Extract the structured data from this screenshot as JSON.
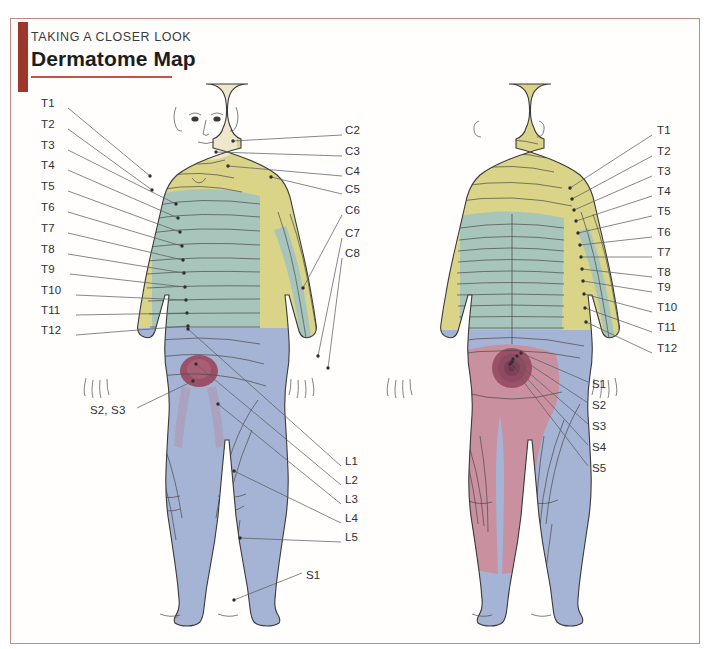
{
  "page": {
    "kicker": "TAKING A CLOSER LOOK",
    "title": "Dermatome Map",
    "frame_color": "#c08b82",
    "accent_bar_color": "#9e372b",
    "rule_color": "#c8534a"
  },
  "palette": {
    "skin": "#f0e6cc",
    "yellow": "#d9d487",
    "teal": "#a8c5bc",
    "blue": "#a5b3d4",
    "rose": "#c9909f",
    "magenta": "#9b5068",
    "outline": "#3a3a3a",
    "leader": "#555a5e"
  },
  "figures": [
    {
      "id": "anterior",
      "view": "anterior-body-figure"
    },
    {
      "id": "posterior",
      "view": "posterior-body-figure"
    }
  ],
  "labels": {
    "left_column": [
      {
        "text": "T1",
        "x": 41,
        "y": 104,
        "lx": 68,
        "ly": 108,
        "tx": 150,
        "ty": 176
      },
      {
        "text": "T2",
        "x": 41,
        "y": 125,
        "lx": 68,
        "ly": 129,
        "tx": 152,
        "ty": 190
      },
      {
        "text": "T3",
        "x": 41,
        "y": 146,
        "lx": 68,
        "ly": 150,
        "tx": 176,
        "ty": 204
      },
      {
        "text": "T4",
        "x": 41,
        "y": 166,
        "lx": 68,
        "ly": 170,
        "tx": 178,
        "ty": 218
      },
      {
        "text": "T5",
        "x": 41,
        "y": 187,
        "lx": 68,
        "ly": 191,
        "tx": 180,
        "ty": 232
      },
      {
        "text": "T6",
        "x": 41,
        "y": 208,
        "lx": 68,
        "ly": 212,
        "tx": 182,
        "ty": 246
      },
      {
        "text": "T7",
        "x": 41,
        "y": 229,
        "lx": 68,
        "ly": 233,
        "tx": 183,
        "ty": 260
      },
      {
        "text": "T8",
        "x": 41,
        "y": 250,
        "lx": 68,
        "ly": 254,
        "tx": 184,
        "ty": 273
      },
      {
        "text": "T9",
        "x": 41,
        "y": 270,
        "lx": 70,
        "ly": 274,
        "tx": 185,
        "ty": 287
      },
      {
        "text": "T10",
        "x": 41,
        "y": 291,
        "lx": 76,
        "ly": 295,
        "tx": 186,
        "ty": 300
      },
      {
        "text": "T11",
        "x": 41,
        "y": 311,
        "lx": 76,
        "ly": 315,
        "tx": 187,
        "ty": 313
      },
      {
        "text": "T12",
        "x": 41,
        "y": 331,
        "lx": 76,
        "ly": 335,
        "tx": 188,
        "ty": 326
      }
    ],
    "left_other": [
      {
        "text": "S2, S3",
        "x": 90,
        "y": 411,
        "lx": 137,
        "ly": 408,
        "tx": 193,
        "ty": 381
      }
    ],
    "center_cervical": [
      {
        "text": "C2",
        "x": 345,
        "y": 131,
        "lx": 342,
        "ly": 135,
        "tx": 233,
        "ty": 141
      },
      {
        "text": "C3",
        "x": 345,
        "y": 152,
        "lx": 342,
        "ly": 156,
        "tx": 216,
        "ty": 152
      },
      {
        "text": "C4",
        "x": 345,
        "y": 172,
        "lx": 342,
        "ly": 176,
        "tx": 228,
        "ty": 166
      },
      {
        "text": "C5",
        "x": 345,
        "y": 190,
        "lx": 342,
        "ly": 194,
        "tx": 271,
        "ty": 177
      },
      {
        "text": "C6",
        "x": 345,
        "y": 211,
        "lx": 342,
        "ly": 215,
        "tx": 303,
        "ty": 288
      },
      {
        "text": "C7",
        "x": 345,
        "y": 234,
        "lx": 342,
        "ly": 238,
        "tx": 318,
        "ty": 356
      },
      {
        "text": "C8",
        "x": 345,
        "y": 254,
        "lx": 342,
        "ly": 258,
        "tx": 328,
        "ty": 368
      }
    ],
    "center_lumbar": [
      {
        "text": "L1",
        "x": 345,
        "y": 462,
        "lx": 341,
        "ly": 466,
        "tx": 188,
        "ty": 329
      },
      {
        "text": "L2",
        "x": 345,
        "y": 481,
        "lx": 341,
        "ly": 485,
        "tx": 196,
        "ty": 364
      },
      {
        "text": "L3",
        "x": 345,
        "y": 500,
        "lx": 341,
        "ly": 504,
        "tx": 218,
        "ty": 404
      },
      {
        "text": "L4",
        "x": 345,
        "y": 519,
        "lx": 341,
        "ly": 523,
        "tx": 234,
        "ty": 471
      },
      {
        "text": "L5",
        "x": 345,
        "y": 538,
        "lx": 341,
        "ly": 542,
        "tx": 240,
        "ty": 538
      }
    ],
    "right_column": [
      {
        "text": "T1",
        "x": 657,
        "y": 131,
        "lx": 652,
        "ly": 135,
        "tx": 570,
        "ty": 188
      },
      {
        "text": "T2",
        "x": 657,
        "y": 152,
        "lx": 652,
        "ly": 156,
        "tx": 572,
        "ty": 199
      },
      {
        "text": "T3",
        "x": 657,
        "y": 172,
        "lx": 652,
        "ly": 176,
        "tx": 574,
        "ty": 210
      },
      {
        "text": "T4",
        "x": 657,
        "y": 192,
        "lx": 652,
        "ly": 196,
        "tx": 576,
        "ty": 221
      },
      {
        "text": "T5",
        "x": 657,
        "y": 212,
        "lx": 652,
        "ly": 216,
        "tx": 578,
        "ty": 233
      },
      {
        "text": "T6",
        "x": 657,
        "y": 233,
        "lx": 652,
        "ly": 237,
        "tx": 580,
        "ty": 245
      },
      {
        "text": "T7",
        "x": 657,
        "y": 253,
        "lx": 652,
        "ly": 257,
        "tx": 581,
        "ty": 257
      },
      {
        "text": "T8",
        "x": 657,
        "y": 273,
        "lx": 652,
        "ly": 277,
        "tx": 582,
        "ty": 269
      },
      {
        "text": "T9",
        "x": 657,
        "y": 288,
        "lx": 652,
        "ly": 292,
        "tx": 583,
        "ty": 281
      },
      {
        "text": "T10",
        "x": 657,
        "y": 308,
        "lx": 652,
        "ly": 312,
        "tx": 584,
        "ty": 294
      },
      {
        "text": "T11",
        "x": 657,
        "y": 328,
        "lx": 652,
        "ly": 332,
        "tx": 585,
        "ty": 308
      },
      {
        "text": "T12",
        "x": 657,
        "y": 349,
        "lx": 652,
        "ly": 353,
        "tx": 586,
        "ty": 322
      }
    ],
    "right_sacral": [
      {
        "text": "S1",
        "x": 592,
        "y": 385,
        "lx": 588,
        "ly": 382,
        "tx": 521,
        "ty": 353
      },
      {
        "text": "S2",
        "x": 592,
        "y": 406,
        "lx": 588,
        "ly": 403,
        "tx": 517,
        "ty": 356
      },
      {
        "text": "S3",
        "x": 592,
        "y": 427,
        "lx": 588,
        "ly": 424,
        "tx": 513,
        "ty": 359
      },
      {
        "text": "S4",
        "x": 592,
        "y": 448,
        "lx": 588,
        "ly": 445,
        "tx": 512,
        "ty": 362
      },
      {
        "text": "S5",
        "x": 592,
        "y": 469,
        "lx": 588,
        "ly": 466,
        "tx": 510,
        "ty": 364
      }
    ],
    "bottom": [
      {
        "text": "S1",
        "x": 306,
        "y": 576,
        "lx": 302,
        "ly": 573,
        "tx": 234,
        "ty": 600
      }
    ]
  }
}
